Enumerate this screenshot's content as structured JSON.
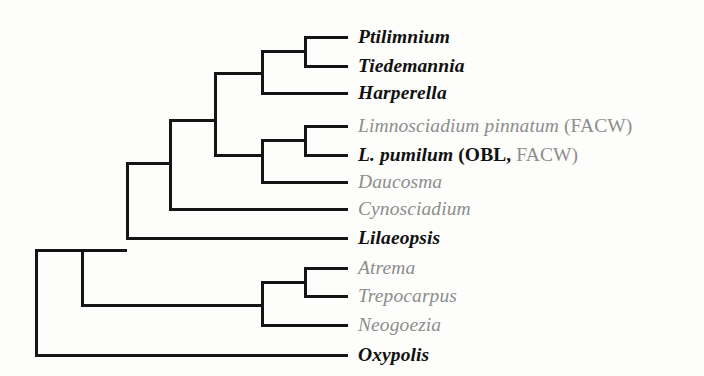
{
  "figure": {
    "kind": "cladogram",
    "background_color": "#fdfdfb",
    "branch_color": "#151515",
    "branch_width": 3,
    "text_color_emphasis": "#111111",
    "text_color_muted": "#8d8d8d",
    "width": 704,
    "height": 376
  },
  "taxa": [
    {
      "id": "ptilimnium",
      "tip_y": 37,
      "tip_x": 348,
      "segments": [
        {
          "text": "Ptilimnium",
          "style": "italic",
          "weight": "bold",
          "color": "black"
        }
      ]
    },
    {
      "id": "tiedemannia",
      "tip_y": 66,
      "tip_x": 348,
      "segments": [
        {
          "text": "Tiedemannia",
          "style": "italic",
          "weight": "bold",
          "color": "black"
        }
      ]
    },
    {
      "id": "harperella",
      "tip_y": 93,
      "tip_x": 348,
      "segments": [
        {
          "text": "Harperella",
          "style": "italic",
          "weight": "bold",
          "color": "black"
        }
      ]
    },
    {
      "id": "limnosciadium-pinnatum",
      "tip_y": 126,
      "tip_x": 348,
      "segments": [
        {
          "text": "Limnosciadium pinnatum",
          "style": "italic",
          "weight": "normal",
          "color": "gray"
        },
        {
          "text": " ",
          "style": "roman",
          "weight": "normal",
          "color": "gray"
        },
        {
          "text": "(FACW)",
          "style": "roman",
          "weight": "normal",
          "color": "gray"
        }
      ]
    },
    {
      "id": "l-pumilum",
      "tip_y": 155,
      "tip_x": 348,
      "segments": [
        {
          "text": "L. pumilum",
          "style": "italic",
          "weight": "bold",
          "color": "black"
        },
        {
          "text": " ",
          "style": "roman",
          "weight": "normal",
          "color": "black"
        },
        {
          "text": "(OBL,",
          "style": "roman",
          "weight": "bold",
          "color": "black"
        },
        {
          "text": " ",
          "style": "roman",
          "weight": "normal",
          "color": "gray"
        },
        {
          "text": "FACW)",
          "style": "roman",
          "weight": "normal",
          "color": "gray"
        }
      ]
    },
    {
      "id": "daucosma",
      "tip_y": 182,
      "tip_x": 348,
      "segments": [
        {
          "text": "Daucosma",
          "style": "italic",
          "weight": "normal",
          "color": "gray"
        }
      ]
    },
    {
      "id": "cynosciadium",
      "tip_y": 209,
      "tip_x": 348,
      "segments": [
        {
          "text": "Cynosciadium",
          "style": "italic",
          "weight": "normal",
          "color": "gray"
        }
      ]
    },
    {
      "id": "lilaeopsis",
      "tip_y": 238,
      "tip_x": 348,
      "segments": [
        {
          "text": "Lilaeopsis",
          "style": "italic",
          "weight": "bold",
          "color": "black"
        }
      ]
    },
    {
      "id": "atrema",
      "tip_y": 268,
      "tip_x": 348,
      "segments": [
        {
          "text": "Atrema",
          "style": "italic",
          "weight": "normal",
          "color": "gray"
        }
      ]
    },
    {
      "id": "trepocarpus",
      "tip_y": 296,
      "tip_x": 348,
      "segments": [
        {
          "text": "Trepocarpus",
          "style": "italic",
          "weight": "normal",
          "color": "gray"
        }
      ]
    },
    {
      "id": "neogoezia",
      "tip_y": 325,
      "tip_x": 348,
      "segments": [
        {
          "text": "Neogoezia",
          "style": "italic",
          "weight": "normal",
          "color": "gray"
        }
      ]
    },
    {
      "id": "oxypolis",
      "tip_y": 355,
      "tip_x": 348,
      "segments": [
        {
          "text": "Oxypolis",
          "style": "italic",
          "weight": "bold",
          "color": "black"
        }
      ]
    }
  ],
  "label_x": 358,
  "tree_edges": [
    {
      "id": "root-stem-vertical",
      "type": "v",
      "x": 36,
      "y1": 250,
      "y2": 355
    },
    {
      "id": "node-a-vertical",
      "type": "v",
      "x": 82,
      "y1": 250,
      "y2": 305
    },
    {
      "id": "node-b-vertical",
      "type": "v",
      "x": 127,
      "y1": 163,
      "y2": 238
    },
    {
      "id": "node-c-vertical",
      "type": "v",
      "x": 170,
      "y1": 120,
      "y2": 209
    },
    {
      "id": "node-d-vertical",
      "type": "v",
      "x": 215,
      "y1": 73,
      "y2": 155
    },
    {
      "id": "node-e-vertical",
      "type": "v",
      "x": 262,
      "y1": 51,
      "y2": 93
    },
    {
      "id": "node-f-vertical",
      "type": "v",
      "x": 305,
      "y1": 37,
      "y2": 66
    },
    {
      "id": "node-g-vertical",
      "type": "v",
      "x": 262,
      "y1": 140,
      "y2": 182
    },
    {
      "id": "node-h-vertical",
      "type": "v",
      "x": 305,
      "y1": 126,
      "y2": 155
    },
    {
      "id": "node-i-vertical",
      "type": "v",
      "x": 262,
      "y1": 282,
      "y2": 325
    },
    {
      "id": "node-j-vertical",
      "type": "v",
      "x": 305,
      "y1": 268,
      "y2": 296
    },
    {
      "id": "branch-root-to-a",
      "type": "h",
      "y": 250,
      "x1": 36,
      "x2": 82
    },
    {
      "id": "branch-root-to-oxypolis",
      "type": "h",
      "y": 355,
      "x1": 36,
      "x2": 348
    },
    {
      "id": "branch-a-to-b",
      "type": "h",
      "y": 250,
      "x1": 82,
      "x2": 127
    },
    {
      "id": "branch-a-to-i",
      "type": "h",
      "y": 305,
      "x1": 82,
      "x2": 262
    },
    {
      "id": "branch-b-to-c",
      "type": "h",
      "y": 163,
      "x1": 127,
      "x2": 170
    },
    {
      "id": "branch-b-to-lilaeopsis",
      "type": "h",
      "y": 238,
      "x1": 127,
      "x2": 348
    },
    {
      "id": "branch-c-to-d",
      "type": "h",
      "y": 120,
      "x1": 170,
      "x2": 215
    },
    {
      "id": "branch-c-to-cynosciadium",
      "type": "h",
      "y": 209,
      "x1": 170,
      "x2": 348
    },
    {
      "id": "branch-d-to-e",
      "type": "h",
      "y": 73,
      "x1": 215,
      "x2": 262
    },
    {
      "id": "branch-d-to-g",
      "type": "h",
      "y": 155,
      "x1": 215,
      "x2": 262
    },
    {
      "id": "branch-e-to-f",
      "type": "h",
      "y": 51,
      "x1": 262,
      "x2": 305
    },
    {
      "id": "branch-e-to-harperella",
      "type": "h",
      "y": 93,
      "x1": 262,
      "x2": 348
    },
    {
      "id": "branch-f-to-ptilimnium",
      "type": "h",
      "y": 37,
      "x1": 305,
      "x2": 348
    },
    {
      "id": "branch-f-to-tiedemannia",
      "type": "h",
      "y": 66,
      "x1": 305,
      "x2": 348
    },
    {
      "id": "branch-g-to-h",
      "type": "h",
      "y": 140,
      "x1": 262,
      "x2": 305
    },
    {
      "id": "branch-g-to-daucosma",
      "type": "h",
      "y": 182,
      "x1": 262,
      "x2": 348
    },
    {
      "id": "branch-h-to-limnoscpinn",
      "type": "h",
      "y": 126,
      "x1": 305,
      "x2": 348
    },
    {
      "id": "branch-h-to-lpumilum",
      "type": "h",
      "y": 155,
      "x1": 305,
      "x2": 348
    },
    {
      "id": "branch-i-to-j",
      "type": "h",
      "y": 282,
      "x1": 262,
      "x2": 305
    },
    {
      "id": "branch-i-to-neogoezia",
      "type": "h",
      "y": 325,
      "x1": 262,
      "x2": 348
    },
    {
      "id": "branch-j-to-atrema",
      "type": "h",
      "y": 268,
      "x1": 305,
      "x2": 348
    },
    {
      "id": "branch-j-to-trepocarpus",
      "type": "h",
      "y": 296,
      "x1": 305,
      "x2": 348
    }
  ]
}
